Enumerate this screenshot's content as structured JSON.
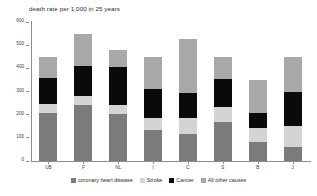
{
  "chart_data": {
    "type": "bar",
    "subtype": "stacked-column",
    "title": "death rate per 1,000 in 25 years",
    "xlabel": "",
    "ylabel": "",
    "ylim": [
      0,
      600
    ],
    "yticks": [
      0,
      100,
      200,
      300,
      400,
      500,
      600
    ],
    "ytick_labels": [
      "0",
      "100",
      "200",
      "300",
      "400",
      "500",
      "600"
    ],
    "grid": false,
    "legend_position": "bottom",
    "categories": [
      "UB",
      "F",
      "NL",
      "I",
      "C",
      "S",
      "B",
      "J"
    ],
    "series": [
      {
        "name": "coronary heart disease",
        "color": "#7b7b7b",
        "values": [
          208,
          240,
          202,
          134,
          115,
          170,
          80,
          62
        ]
      },
      {
        "name": "Stroke",
        "color": "#d4d4d4",
        "values": [
          40,
          40,
          40,
          50,
          72,
          65,
          62,
          90
        ]
      },
      {
        "name": "Cancer",
        "color": "#0a0a0a",
        "values": [
          110,
          130,
          166,
          128,
          106,
          120,
          66,
          146
        ]
      },
      {
        "name": "All other causes",
        "color": "#a8a8a8",
        "values": [
          92,
          140,
          72,
          138,
          232,
          95,
          142,
          152
        ]
      }
    ],
    "totals": [
      450,
      550,
      480,
      450,
      525,
      450,
      350,
      450
    ],
    "legend_entries": [
      "coronary heart disease",
      "Stroke",
      "Cancer",
      "All other causes"
    ]
  },
  "colors": {
    "axis": "#8d8d8d",
    "text": "#2b2b2b",
    "background": "#ffffff"
  }
}
